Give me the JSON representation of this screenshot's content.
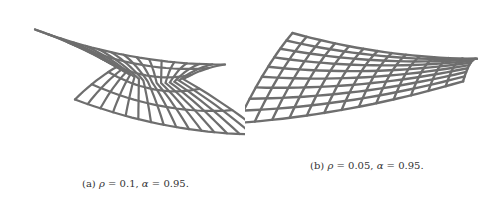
{
  "figures": [
    {
      "id": "a",
      "label": "(a)",
      "rho_symbol": "ρ",
      "rho_value": "0.1",
      "alpha_symbol": "α",
      "alpha_value": "0.95",
      "caption": "(a) ρ = 0.1, α = 0.95."
    },
    {
      "id": "b",
      "label": "(b)",
      "rho_symbol": "ρ",
      "rho_value": "0.05",
      "alpha_symbol": "α",
      "alpha_value": "0.95",
      "caption": "(b) ρ = 0.05, α = 0.95."
    }
  ],
  "colors": {
    "line": "#6e6e6e",
    "text": "#333333",
    "background": "#ffffff"
  }
}
